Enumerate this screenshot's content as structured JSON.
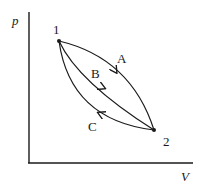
{
  "diagram": {
    "type": "pV-diagram",
    "axes": {
      "y_label": "p",
      "x_label": "V"
    },
    "points": [
      {
        "id": "1",
        "label": "1"
      },
      {
        "id": "2",
        "label": "2"
      }
    ],
    "paths": [
      {
        "id": "A",
        "label": "A",
        "from": "1",
        "to": "2",
        "direction": "1→2"
      },
      {
        "id": "B",
        "label": "B",
        "from": "1",
        "to": "2",
        "direction": "1→2"
      },
      {
        "id": "C",
        "label": "C",
        "from": "2",
        "to": "1",
        "direction": "2→1"
      }
    ],
    "colors": {
      "ink": "#1a1a1a",
      "background": "#ffffff"
    }
  }
}
